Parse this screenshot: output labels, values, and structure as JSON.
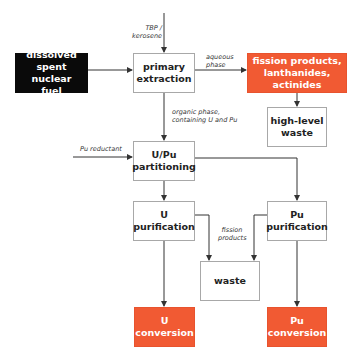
{
  "diagram": {
    "colors": {
      "accent_orange": "#f15a33",
      "black_box": "#0a0a0a",
      "box_border": "#a8a8a8",
      "line": "#333333"
    },
    "boxes": {
      "dissolved_fuel": "dissolved\nspent nuclear\nfuel",
      "primary_extraction": "primary\nextraction",
      "fission_products": "fission products,\nlanthanides,\nactinides",
      "high_level_waste": "high-level\nwaste",
      "u_pu_partitioning": "U/Pu\npartitioning",
      "u_purification": "U\npurification",
      "pu_purification": "Pu\npurification",
      "waste": "waste",
      "u_conversion": "U\nconversion",
      "pu_conversion": "Pu\nconversion"
    },
    "labels": {
      "tbp_kerosene": "TBP /\nkerosene",
      "aqueous_phase": "aqueous\nphase",
      "organic_phase": "organic phase,\ncontaining U and Pu",
      "pu_reductant": "Pu reductant",
      "fission_products_flow": "fission\nproducts"
    }
  }
}
